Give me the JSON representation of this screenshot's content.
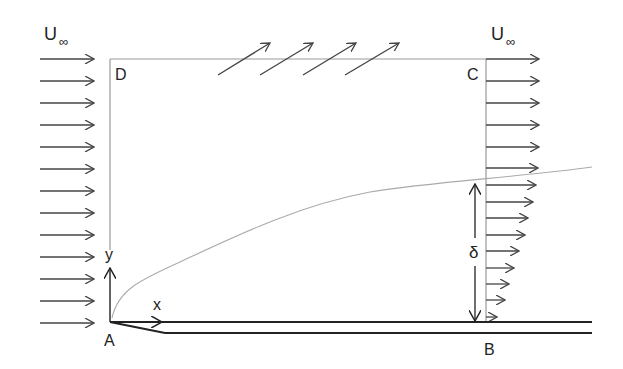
{
  "diagram": {
    "labels": {
      "freestream_left": "U",
      "freestream_left_sub": "∞",
      "freestream_right": "U",
      "freestream_right_sub": "∞",
      "corner_A": "A",
      "corner_B": "B",
      "corner_C": "C",
      "corner_D": "D",
      "axis_x": "x",
      "axis_y": "y",
      "thickness": "δ"
    },
    "colors": {
      "arrow": "#444444",
      "box": "#999999",
      "boundary_curve": "#aaaaaa",
      "plate": "#222222"
    },
    "inflow_arrow_count": 13,
    "outflow_uniform_arrow_count": 6,
    "outflow_profile_arrow_count": 9,
    "mass_outflow_arrow_count": 4
  }
}
